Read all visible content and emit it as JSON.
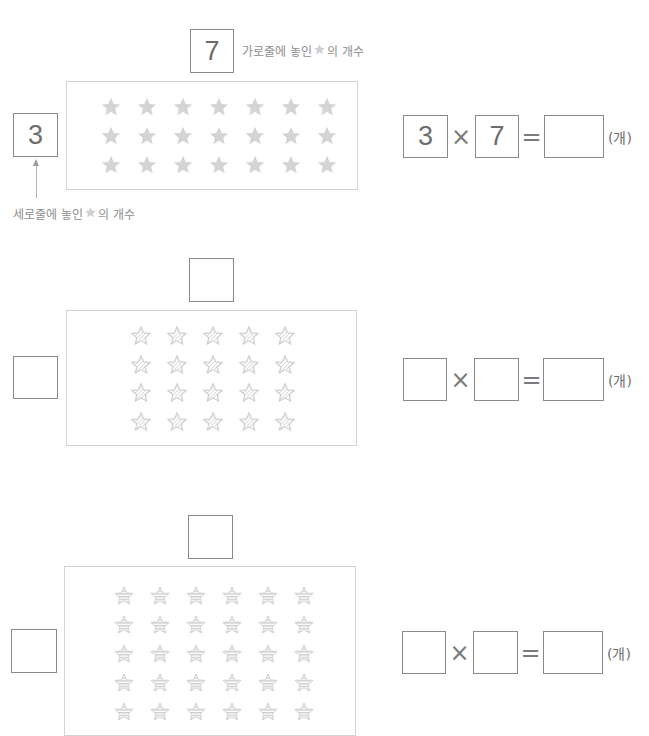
{
  "problems": [
    {
      "id": "example",
      "top_box_value": "7",
      "left_box_value": "3",
      "top_label": {
        "before": "가로줄에 놓인 ",
        "after": "의 개수"
      },
      "left_label": {
        "before": "세로줄에 놓인 ",
        "after": "의 개수"
      },
      "stars": {
        "rows": 3,
        "cols": 7,
        "style": "solid",
        "color": "#d4d4d4"
      },
      "equation": {
        "a": "3",
        "op1": "×",
        "b": "7",
        "op2": "=",
        "result": "",
        "unit": "(개)"
      }
    },
    {
      "id": "problem-2",
      "top_box_value": "",
      "left_box_value": "",
      "stars": {
        "rows": 4,
        "cols": 5,
        "style": "hatched",
        "color": "#cfcfcf"
      },
      "equation": {
        "a": "",
        "op1": "×",
        "b": "",
        "op2": "=",
        "result": "",
        "unit": "(개)"
      }
    },
    {
      "id": "problem-3",
      "top_box_value": "",
      "left_box_value": "",
      "stars": {
        "rows": 5,
        "cols": 6,
        "style": "striped",
        "color": "#cfcfcf"
      },
      "equation": {
        "a": "",
        "op1": "×",
        "b": "",
        "op2": "=",
        "result": "",
        "unit": "(개)"
      }
    }
  ],
  "colors": {
    "box_border": "#8a8a8a",
    "panel_border": "#d2d2d2",
    "star": "#d4d4d4",
    "label_text": "#8e8e8e"
  }
}
